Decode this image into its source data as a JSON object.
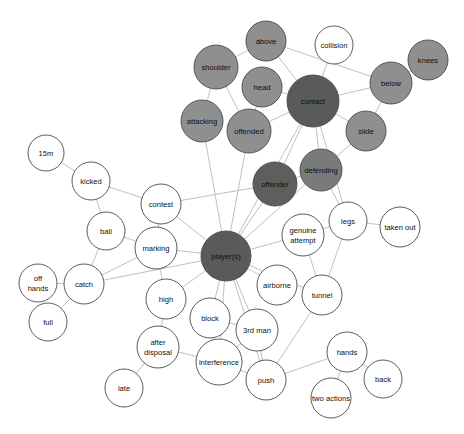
{
  "graph": {
    "title": "player(s) contact network",
    "type": "node-link-graph",
    "width": 464,
    "height": 434,
    "background": "#ffffff",
    "edge_color": "#b9b9b9",
    "node_stroke": "#4a4a4a",
    "palette": {
      "hub_dark": "#4d4d4d",
      "dark": "#5e5e5e",
      "medium": "#8f8f8f",
      "light": "#a8a8a8",
      "white": "#ffffff"
    },
    "nodes": [
      {
        "id": "above",
        "label": "above",
        "x": 266,
        "y": 41,
        "r": 20,
        "fill": "#8f8f8f",
        "dark_text": true
      },
      {
        "id": "collision",
        "label": "collision",
        "x": 334,
        "y": 45,
        "r": 19,
        "fill": "#ffffff",
        "dark_text": false
      },
      {
        "id": "knees",
        "label": "knees",
        "x": 428,
        "y": 60,
        "r": 20,
        "fill": "#8f8f8f",
        "dark_text": true
      },
      {
        "id": "shoulder",
        "label": "shoulder",
        "x": 216,
        "y": 67,
        "r": 22,
        "fill": "#8f8f8f",
        "dark_text": true
      },
      {
        "id": "head",
        "label": "head",
        "x": 262,
        "y": 87,
        "r": 20,
        "fill": "#8f8f8f",
        "dark_text": true
      },
      {
        "id": "below",
        "label": "below",
        "x": 391,
        "y": 83,
        "r": 21,
        "fill": "#8f8f8f",
        "dark_text": true
      },
      {
        "id": "contact",
        "label": "contact",
        "x": 313,
        "y": 101,
        "r": 26,
        "fill": "#5a5a5a",
        "dark_text": true
      },
      {
        "id": "attacking",
        "label": "attacking",
        "x": 202,
        "y": 121,
        "r": 21,
        "fill": "#8f8f8f",
        "dark_text": true
      },
      {
        "id": "offended",
        "label": "offended",
        "x": 249,
        "y": 131,
        "r": 22,
        "fill": "#8f8f8f",
        "dark_text": true
      },
      {
        "id": "slide",
        "label": "slide",
        "x": 366,
        "y": 131,
        "r": 20,
        "fill": "#8f8f8f",
        "dark_text": true
      },
      {
        "id": "defending",
        "label": "defending",
        "x": 321,
        "y": 170,
        "r": 21,
        "fill": "#7a7a7a",
        "dark_text": true
      },
      {
        "id": "15m",
        "label": "15m",
        "x": 46,
        "y": 153,
        "r": 18,
        "fill": "#ffffff",
        "dark_text": false
      },
      {
        "id": "offender",
        "label": "offender",
        "x": 275,
        "y": 184,
        "r": 22,
        "fill": "#5e5e5e",
        "dark_text": true
      },
      {
        "id": "kicked",
        "label": "kicked",
        "x": 91,
        "y": 181,
        "r": 19,
        "fill": "#ffffff",
        "dark_text": false
      },
      {
        "id": "contest",
        "label": "contest",
        "x": 161,
        "y": 204,
        "r": 20,
        "fill": "#ffffff",
        "dark_text": false
      },
      {
        "id": "legs",
        "label": "legs",
        "x": 348,
        "y": 221,
        "r": 19,
        "fill": "#ffffff",
        "dark_text": false
      },
      {
        "id": "taken_out",
        "label": "taken out",
        "x": 400,
        "y": 227,
        "r": 20,
        "fill": "#ffffff",
        "dark_text": false
      },
      {
        "id": "ball",
        "label": "ball",
        "x": 106,
        "y": 231,
        "r": 19,
        "fill": "#ffffff",
        "dark_text": false
      },
      {
        "id": "marking",
        "label": "marking",
        "x": 156,
        "y": 248,
        "r": 21,
        "fill": "#ffffff",
        "dark_text": false
      },
      {
        "id": "genuine_attempt",
        "label": "genuine attempt",
        "x": 303,
        "y": 235,
        "r": 21,
        "fill": "#ffffff",
        "dark_text": false,
        "two_line": true,
        "line1": "genuine",
        "line2": "attempt"
      },
      {
        "id": "players",
        "label": "player(s)",
        "x": 226,
        "y": 256,
        "r": 25,
        "fill": "#5a5a5a",
        "dark_text": true
      },
      {
        "id": "off_hands",
        "label": "off hands",
        "x": 38,
        "y": 283,
        "r": 19,
        "fill": "#ffffff",
        "dark_text": false,
        "two_line": true,
        "line1": "off",
        "line2": "hands"
      },
      {
        "id": "catch",
        "label": "catch",
        "x": 84,
        "y": 284,
        "r": 20,
        "fill": "#ffffff",
        "dark_text": false
      },
      {
        "id": "airborne",
        "label": "airborne",
        "x": 277,
        "y": 285,
        "r": 20,
        "fill": "#ffffff",
        "dark_text": false
      },
      {
        "id": "tunnel",
        "label": "tunnel",
        "x": 322,
        "y": 295,
        "r": 20,
        "fill": "#ffffff",
        "dark_text": false
      },
      {
        "id": "high",
        "label": "high",
        "x": 166,
        "y": 299,
        "r": 20,
        "fill": "#ffffff",
        "dark_text": false
      },
      {
        "id": "full",
        "label": "full",
        "x": 48,
        "y": 322,
        "r": 19,
        "fill": "#ffffff",
        "dark_text": false
      },
      {
        "id": "block",
        "label": "block",
        "x": 210,
        "y": 318,
        "r": 20,
        "fill": "#ffffff",
        "dark_text": false
      },
      {
        "id": "third_man",
        "label": "3rd man",
        "x": 257,
        "y": 330,
        "r": 21,
        "fill": "#ffffff",
        "dark_text": false
      },
      {
        "id": "after_disposal",
        "label": "after disposal",
        "x": 158,
        "y": 347,
        "r": 21,
        "fill": "#ffffff",
        "dark_text": false,
        "two_line": true,
        "line1": "after",
        "line2": "disposal"
      },
      {
        "id": "hands",
        "label": "hands",
        "x": 347,
        "y": 352,
        "r": 20,
        "fill": "#ffffff",
        "dark_text": false
      },
      {
        "id": "interference",
        "label": "interference",
        "x": 219,
        "y": 362,
        "r": 23,
        "fill": "#ffffff",
        "dark_text": false
      },
      {
        "id": "back",
        "label": "back",
        "x": 383,
        "y": 379,
        "r": 19,
        "fill": "#ffffff",
        "dark_text": false
      },
      {
        "id": "push",
        "label": "push",
        "x": 266,
        "y": 380,
        "r": 20,
        "fill": "#ffffff",
        "dark_text": false
      },
      {
        "id": "late",
        "label": "late",
        "x": 124,
        "y": 388,
        "r": 19,
        "fill": "#ffffff",
        "dark_text": false
      },
      {
        "id": "two_actions",
        "label": "two actions",
        "x": 331,
        "y": 398,
        "r": 20,
        "fill": "#ffffff",
        "dark_text": false
      }
    ],
    "edges": [
      {
        "source": "above",
        "target": "contact"
      },
      {
        "source": "above",
        "target": "shoulder"
      },
      {
        "source": "above",
        "target": "below"
      },
      {
        "source": "collision",
        "target": "contact"
      },
      {
        "source": "knees",
        "target": "below"
      },
      {
        "source": "below",
        "target": "contact"
      },
      {
        "source": "below",
        "target": "slide"
      },
      {
        "source": "shoulder",
        "target": "attacking"
      },
      {
        "source": "shoulder",
        "target": "offended"
      },
      {
        "source": "head",
        "target": "contact"
      },
      {
        "source": "head",
        "target": "offended"
      },
      {
        "source": "contact",
        "target": "offended"
      },
      {
        "source": "contact",
        "target": "slide"
      },
      {
        "source": "contact",
        "target": "defending"
      },
      {
        "source": "contact",
        "target": "offender"
      },
      {
        "source": "contact",
        "target": "players"
      },
      {
        "source": "contact",
        "target": "legs"
      },
      {
        "source": "slide",
        "target": "defending"
      },
      {
        "source": "defending",
        "target": "offender"
      },
      {
        "source": "defending",
        "target": "players"
      },
      {
        "source": "defending",
        "target": "legs"
      },
      {
        "source": "offender",
        "target": "players"
      },
      {
        "source": "offender",
        "target": "contest"
      },
      {
        "source": "offended",
        "target": "players"
      },
      {
        "source": "attacking",
        "target": "players"
      },
      {
        "source": "15m",
        "target": "kicked"
      },
      {
        "source": "kicked",
        "target": "ball"
      },
      {
        "source": "kicked",
        "target": "contest"
      },
      {
        "source": "contest",
        "target": "marking"
      },
      {
        "source": "contest",
        "target": "players"
      },
      {
        "source": "ball",
        "target": "marking"
      },
      {
        "source": "ball",
        "target": "catch"
      },
      {
        "source": "marking",
        "target": "players"
      },
      {
        "source": "marking",
        "target": "high"
      },
      {
        "source": "marking",
        "target": "catch"
      },
      {
        "source": "genuine_attempt",
        "target": "players"
      },
      {
        "source": "genuine_attempt",
        "target": "legs"
      },
      {
        "source": "genuine_attempt",
        "target": "tunnel"
      },
      {
        "source": "legs",
        "target": "taken_out"
      },
      {
        "source": "legs",
        "target": "tunnel"
      },
      {
        "source": "players",
        "target": "airborne"
      },
      {
        "source": "players",
        "target": "tunnel"
      },
      {
        "source": "players",
        "target": "high"
      },
      {
        "source": "players",
        "target": "block"
      },
      {
        "source": "players",
        "target": "third_man"
      },
      {
        "source": "players",
        "target": "interference"
      },
      {
        "source": "players",
        "target": "push"
      },
      {
        "source": "players",
        "target": "catch"
      },
      {
        "source": "off_hands",
        "target": "catch"
      },
      {
        "source": "catch",
        "target": "full"
      },
      {
        "source": "high",
        "target": "after_disposal"
      },
      {
        "source": "block",
        "target": "interference"
      },
      {
        "source": "block",
        "target": "third_man"
      },
      {
        "source": "third_man",
        "target": "interference"
      },
      {
        "source": "third_man",
        "target": "push"
      },
      {
        "source": "after_disposal",
        "target": "interference"
      },
      {
        "source": "after_disposal",
        "target": "late"
      },
      {
        "source": "interference",
        "target": "push"
      },
      {
        "source": "push",
        "target": "hands"
      },
      {
        "source": "push",
        "target": "tunnel"
      },
      {
        "source": "hands",
        "target": "back"
      },
      {
        "source": "hands",
        "target": "two_actions"
      }
    ]
  }
}
